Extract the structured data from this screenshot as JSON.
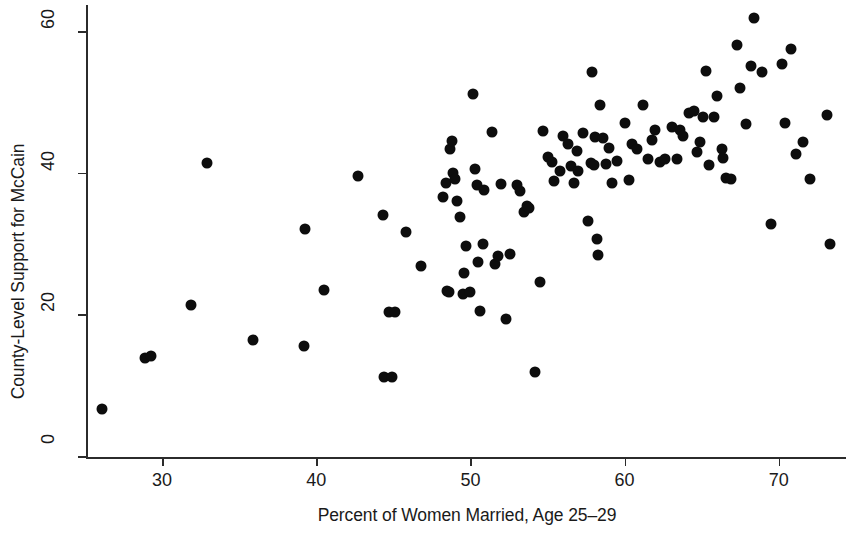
{
  "chart_data": {
    "type": "scatter",
    "title": "",
    "xlabel": "Percent of Women Married, Age 25–29",
    "ylabel": "County-Level Support for McCain",
    "xlim": [
      25.2,
      74.5
    ],
    "ylim": [
      -0.8,
      63.5
    ],
    "xticks": [
      30,
      40,
      50,
      60,
      70
    ],
    "xtick_labels": [
      "30",
      "40",
      "50",
      "60",
      "70"
    ],
    "yticks": [
      0,
      20,
      40,
      60
    ],
    "ytick_labels": [
      "0",
      "20",
      "40",
      "60"
    ],
    "grid": false,
    "legend": null,
    "marker": {
      "shape": "circle",
      "color": "#0d0d0d",
      "size_px": 11
    },
    "n_points": 118,
    "points": [
      [
        26.1,
        6.6
      ],
      [
        28.9,
        13.9
      ],
      [
        29.3,
        14.1
      ],
      [
        31.9,
        21.3
      ],
      [
        32.9,
        41.4
      ],
      [
        35.9,
        16.4
      ],
      [
        39.2,
        15.6
      ],
      [
        39.3,
        32.1
      ],
      [
        40.5,
        23.4
      ],
      [
        42.7,
        39.6
      ],
      [
        44.3,
        34.0
      ],
      [
        44.4,
        11.1
      ],
      [
        44.7,
        20.4
      ],
      [
        44.9,
        11.2
      ],
      [
        45.1,
        20.3
      ],
      [
        45.8,
        31.7
      ],
      [
        46.8,
        26.9
      ],
      [
        48.2,
        36.6
      ],
      [
        48.4,
        38.5
      ],
      [
        48.5,
        23.3
      ],
      [
        48.6,
        23.1
      ],
      [
        48.7,
        43.4
      ],
      [
        48.8,
        44.5
      ],
      [
        48.9,
        40.0
      ],
      [
        49.0,
        39.1
      ],
      [
        49.1,
        36.0
      ],
      [
        49.3,
        33.8
      ],
      [
        49.5,
        22.9
      ],
      [
        49.6,
        25.9
      ],
      [
        49.7,
        29.7
      ],
      [
        50.0,
        23.1
      ],
      [
        50.2,
        51.2
      ],
      [
        50.3,
        40.5
      ],
      [
        50.4,
        38.3
      ],
      [
        50.5,
        27.4
      ],
      [
        50.6,
        20.5
      ],
      [
        50.8,
        29.9
      ],
      [
        50.9,
        37.6
      ],
      [
        51.4,
        45.7
      ],
      [
        51.6,
        27.1
      ],
      [
        51.8,
        28.2
      ],
      [
        52.0,
        38.4
      ],
      [
        52.3,
        19.3
      ],
      [
        52.6,
        28.6
      ],
      [
        53.0,
        38.3
      ],
      [
        53.2,
        37.4
      ],
      [
        53.5,
        34.5
      ],
      [
        53.7,
        35.3
      ],
      [
        53.8,
        35.0
      ],
      [
        54.2,
        11.9
      ],
      [
        54.5,
        24.6
      ],
      [
        54.7,
        45.9
      ],
      [
        55.0,
        42.2
      ],
      [
        55.3,
        41.5
      ],
      [
        55.4,
        38.9
      ],
      [
        55.8,
        40.3
      ],
      [
        56.0,
        45.2
      ],
      [
        56.3,
        44.1
      ],
      [
        56.5,
        41.0
      ],
      [
        56.7,
        38.6
      ],
      [
        56.9,
        43.1
      ],
      [
        57.0,
        40.3
      ],
      [
        57.3,
        45.6
      ],
      [
        57.6,
        33.2
      ],
      [
        57.8,
        41.4
      ],
      [
        57.9,
        54.2
      ],
      [
        58.0,
        41.1
      ],
      [
        58.1,
        45.0
      ],
      [
        58.2,
        30.6
      ],
      [
        58.3,
        28.4
      ],
      [
        58.4,
        49.6
      ],
      [
        58.6,
        44.9
      ],
      [
        58.8,
        41.3
      ],
      [
        59.0,
        43.5
      ],
      [
        59.2,
        38.5
      ],
      [
        59.5,
        41.7
      ],
      [
        60.0,
        47.0
      ],
      [
        60.3,
        39.0
      ],
      [
        60.5,
        44.0
      ],
      [
        60.8,
        43.4
      ],
      [
        61.2,
        49.6
      ],
      [
        61.5,
        41.9
      ],
      [
        61.8,
        44.7
      ],
      [
        62.0,
        46.1
      ],
      [
        62.3,
        41.5
      ],
      [
        62.6,
        42.0
      ],
      [
        63.1,
        46.4
      ],
      [
        63.4,
        41.9
      ],
      [
        63.6,
        46.0
      ],
      [
        63.8,
        45.2
      ],
      [
        64.2,
        48.4
      ],
      [
        64.5,
        48.7
      ],
      [
        64.7,
        43.0
      ],
      [
        64.9,
        44.4
      ],
      [
        65.1,
        47.9
      ],
      [
        65.3,
        54.4
      ],
      [
        65.5,
        41.1
      ],
      [
        65.8,
        47.9
      ],
      [
        66.0,
        50.9
      ],
      [
        66.3,
        43.3
      ],
      [
        66.4,
        42.1
      ],
      [
        66.6,
        39.2
      ],
      [
        66.9,
        39.1
      ],
      [
        67.3,
        58.1
      ],
      [
        67.5,
        52.0
      ],
      [
        67.9,
        46.9
      ],
      [
        68.2,
        55.1
      ],
      [
        68.4,
        61.8
      ],
      [
        68.9,
        54.2
      ],
      [
        69.5,
        32.8
      ],
      [
        70.2,
        55.4
      ],
      [
        70.4,
        47.0
      ],
      [
        70.8,
        57.5
      ],
      [
        71.1,
        42.6
      ],
      [
        71.6,
        44.3
      ],
      [
        72.0,
        39.1
      ],
      [
        73.1,
        48.2
      ],
      [
        73.3,
        30.0
      ]
    ]
  },
  "axes": {
    "x_title": "Percent of Women Married, Age 25–29",
    "y_title": "County-Level Support for McCain"
  }
}
